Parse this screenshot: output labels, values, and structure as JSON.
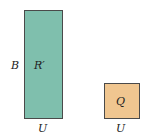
{
  "diagram": {
    "shapes": [
      {
        "id": "R",
        "label": "R′",
        "side_label": "B",
        "bottom_label": "U",
        "color": "#7fbfad"
      },
      {
        "id": "Q",
        "label": "Q",
        "bottom_label": "U",
        "color": "#f0c690"
      }
    ]
  }
}
